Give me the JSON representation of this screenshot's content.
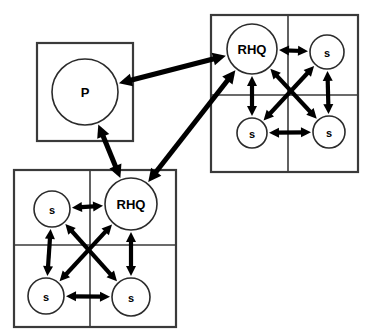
{
  "figure": {
    "background_color": "#ffffff",
    "line_color": "#000000",
    "box_stroke_color": "#3a3a3a",
    "width": 378,
    "height": 335
  },
  "boxes": [
    {
      "id": "box-p",
      "name": "parent-box",
      "label": "P box",
      "x": 37,
      "y": 43,
      "w": 96,
      "h": 98,
      "grid": {
        "rows": 1,
        "cols": 1
      }
    },
    {
      "id": "box-region-top",
      "name": "top-right-region-box",
      "label": "Top right region grid",
      "x": 211,
      "y": 15,
      "w": 147,
      "h": 157,
      "grid": {
        "rows": 2,
        "cols": 2,
        "divider_x": 288,
        "divider_y": 95
      }
    },
    {
      "id": "box-region-bottom",
      "name": "bottom-left-region-box",
      "label": "Bottom left region grid",
      "x": 14,
      "y": 170,
      "w": 162,
      "h": 157,
      "grid": {
        "rows": 2,
        "cols": 2,
        "divider_x": 90,
        "divider_y": 245
      }
    }
  ],
  "nodes": [
    {
      "id": "p",
      "label": "P",
      "box": "box-p",
      "cx": 85,
      "cy": 92,
      "r": 33,
      "size": "big"
    },
    {
      "id": "rhq-top",
      "label": "RHQ",
      "box": "box-region-top",
      "cx": 252,
      "cy": 49,
      "r": 25,
      "size": "big"
    },
    {
      "id": "s-top-ne",
      "label": "s",
      "box": "box-region-top",
      "cx": 327,
      "cy": 52,
      "r": 17,
      "size": "small"
    },
    {
      "id": "s-top-sw",
      "label": "s",
      "box": "box-region-top",
      "cx": 252,
      "cy": 133,
      "r": 15,
      "size": "small"
    },
    {
      "id": "s-top-se",
      "label": "s",
      "box": "box-region-top",
      "cx": 329,
      "cy": 132,
      "r": 16,
      "size": "small"
    },
    {
      "id": "rhq-bot",
      "label": "RHQ",
      "box": "box-region-bottom",
      "cx": 131,
      "cy": 204,
      "r": 26,
      "size": "big"
    },
    {
      "id": "s-bot-nw",
      "label": "s",
      "box": "box-region-bottom",
      "cx": 52,
      "cy": 209,
      "r": 18,
      "size": "small"
    },
    {
      "id": "s-bot-sw",
      "label": "s",
      "box": "box-region-bottom",
      "cx": 46,
      "cy": 296,
      "r": 18,
      "size": "small"
    },
    {
      "id": "s-bot-se",
      "label": "s",
      "box": "box-region-bottom",
      "cx": 131,
      "cy": 297,
      "r": 19,
      "size": "small"
    }
  ],
  "links": [
    {
      "id": "l1",
      "name": "link-p-to-rhq-top",
      "from": "p",
      "to": "rhq-top",
      "kind": "inter",
      "bidirectional": true
    },
    {
      "id": "l2",
      "name": "link-p-to-rhq-bottom",
      "from": "p",
      "to": "rhq-bot",
      "kind": "inter",
      "bidirectional": true
    },
    {
      "id": "l3",
      "name": "link-rhq-top-to-rhq-bottom",
      "from": "rhq-top",
      "to": "rhq-bot",
      "kind": "inter",
      "bidirectional": true
    },
    {
      "id": "l4",
      "name": "link-rhq-top-to-s-ne",
      "from": "rhq-top",
      "to": "s-top-ne",
      "kind": "intra",
      "bidirectional": true
    },
    {
      "id": "l5",
      "name": "link-rhq-top-to-s-sw",
      "from": "rhq-top",
      "to": "s-top-sw",
      "kind": "intra",
      "bidirectional": true
    },
    {
      "id": "l6",
      "name": "link-rhq-top-to-s-se",
      "from": "rhq-top",
      "to": "s-top-se",
      "kind": "intra",
      "bidirectional": true
    },
    {
      "id": "l7",
      "name": "link-s-ne-to-s-sw-top",
      "from": "s-top-ne",
      "to": "s-top-sw",
      "kind": "intra",
      "bidirectional": true
    },
    {
      "id": "l8",
      "name": "link-s-ne-to-s-se-top",
      "from": "s-top-ne",
      "to": "s-top-se",
      "kind": "intra",
      "bidirectional": true
    },
    {
      "id": "l9",
      "name": "link-s-sw-to-s-se-top",
      "from": "s-top-sw",
      "to": "s-top-se",
      "kind": "intra",
      "bidirectional": true
    },
    {
      "id": "l10",
      "name": "link-rhq-bottom-to-s-nw",
      "from": "rhq-bot",
      "to": "s-bot-nw",
      "kind": "intra",
      "bidirectional": true
    },
    {
      "id": "l11",
      "name": "link-rhq-bottom-to-s-sw",
      "from": "rhq-bot",
      "to": "s-bot-sw",
      "kind": "intra",
      "bidirectional": true
    },
    {
      "id": "l12",
      "name": "link-rhq-bottom-to-s-se",
      "from": "rhq-bot",
      "to": "s-bot-se",
      "kind": "intra",
      "bidirectional": true
    },
    {
      "id": "l13",
      "name": "link-s-nw-to-s-sw-bottom",
      "from": "s-bot-nw",
      "to": "s-bot-sw",
      "kind": "intra",
      "bidirectional": true
    },
    {
      "id": "l14",
      "name": "link-s-nw-to-s-se-bottom",
      "from": "s-bot-nw",
      "to": "s-bot-se",
      "kind": "intra",
      "bidirectional": true
    },
    {
      "id": "l15",
      "name": "link-s-sw-to-s-se-bottom",
      "from": "s-bot-sw",
      "to": "s-bot-se",
      "kind": "intra",
      "bidirectional": true
    }
  ]
}
